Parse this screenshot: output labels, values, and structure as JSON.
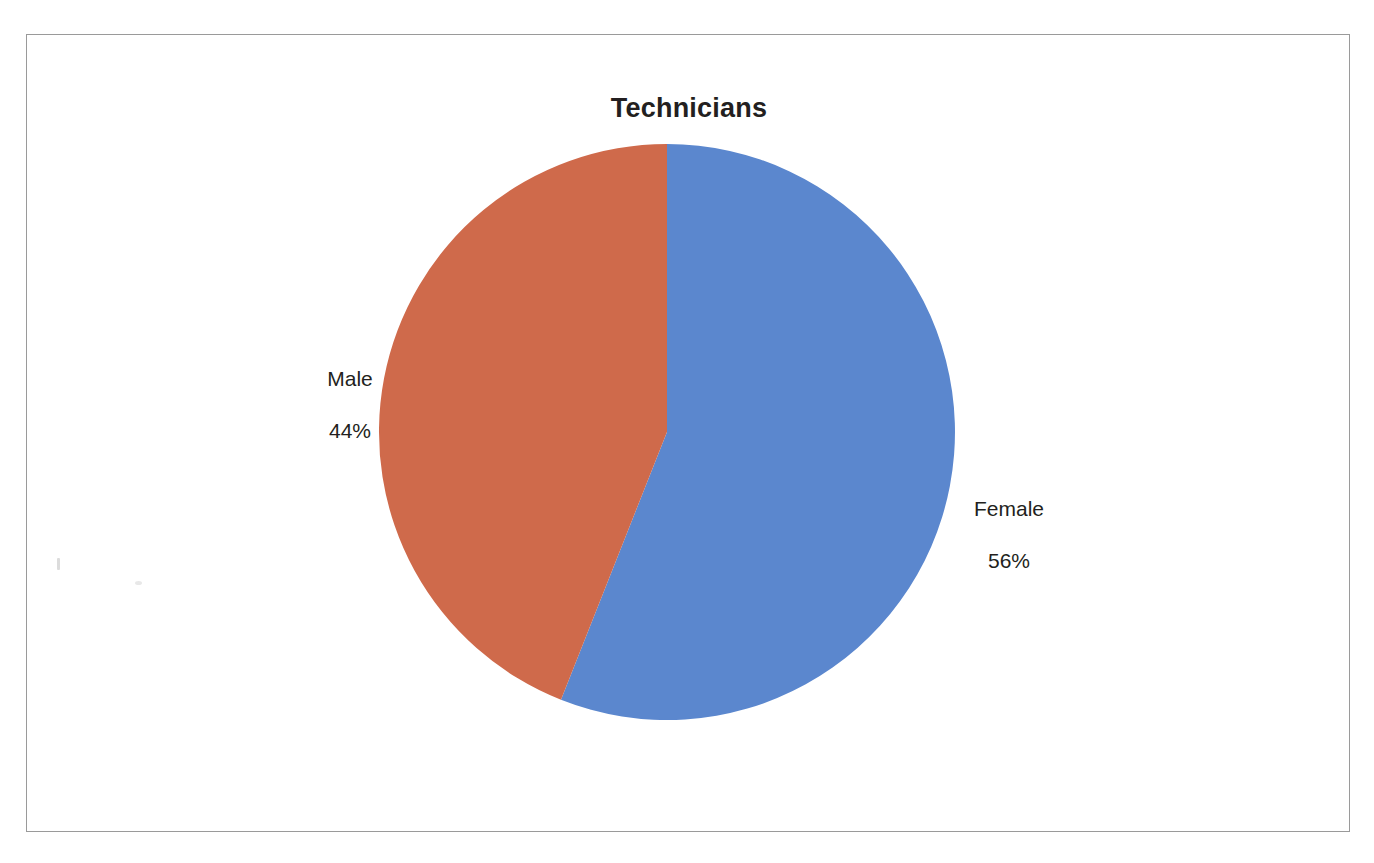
{
  "document": {
    "background_color": "#ffffff",
    "frame_border_color": "#9a9a9a"
  },
  "chart_data": {
    "type": "pie",
    "title": "Technicians",
    "subtitle": "",
    "xlabel": "",
    "ylabel": "",
    "legend_position": "none",
    "grid": false,
    "labels_outside": true,
    "start_angle_deg": 0,
    "direction": "clockwise",
    "categories": [
      "Female",
      "Male"
    ],
    "values": [
      56,
      44
    ],
    "value_unit": "%",
    "colors": [
      "#5b87ce",
      "#cf6a4b"
    ],
    "slices": [
      {
        "name": "Female",
        "value": 56,
        "display_value": "56%",
        "label_text": "Female\n56%",
        "color": "#5b87ce",
        "start_angle_deg": 0,
        "end_angle_deg": 201.6
      },
      {
        "name": "Male",
        "value": 44,
        "display_value": "44%",
        "label_text": "Male\n44%",
        "color": "#cf6a4b",
        "start_angle_deg": 201.6,
        "end_angle_deg": 360
      }
    ],
    "annotations": []
  },
  "labels": {
    "male": {
      "name": "Male",
      "value": "44%"
    },
    "female": {
      "name": "Female",
      "value": "56%"
    }
  }
}
